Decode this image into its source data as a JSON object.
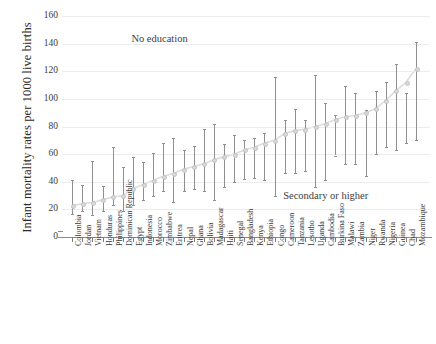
{
  "chart_data": {
    "type": "line",
    "title": "",
    "subtitle": "",
    "xlabel": "",
    "ylabel": "Infant mortality rates per 1000 live births",
    "ylim": [
      0,
      160
    ],
    "yticks": [
      0,
      20,
      40,
      60,
      80,
      100,
      120,
      140,
      160
    ],
    "grid": true,
    "legend_position": "none",
    "annotations": [
      {
        "text": "No education",
        "x_index": 10,
        "y_value": 143
      },
      {
        "text": "Secondary or higher",
        "x_index": 25,
        "y_value": 30
      }
    ],
    "categories": [
      "Colombia",
      "Jordan",
      "Vietnam",
      "Honduras",
      "Philippines",
      "Dominican Republic",
      "Egypt",
      "Indonesia",
      "Morocco",
      "Zimbabwe",
      "Eritrea",
      "Nepal",
      "Ghana",
      "Bolivia",
      "Madagascar",
      "Haiti",
      "Senegal",
      "Bangladesh",
      "Kenya",
      "Ethiopia",
      "Congo",
      "Cameroon",
      "Tanzania",
      "Lesotho",
      "Uganda",
      "Cambodia",
      "Burkina Faso",
      "Malawi",
      "Zambia",
      "Niger",
      "Rwanda",
      "Nigeria",
      "Guinea",
      "Chad",
      "Mozambique"
    ],
    "series": [
      {
        "name": "Point estimate",
        "values": [
          23,
          24,
          25,
          27,
          29,
          30,
          35,
          38,
          41,
          44,
          46,
          49,
          51,
          53,
          56,
          58,
          60,
          63,
          65,
          68,
          70,
          75,
          77,
          78,
          80,
          82,
          85,
          87,
          88,
          90,
          93,
          99,
          106,
          112,
          122
        ]
      }
    ],
    "error_bars": {
      "description": "Vertical range bars spanning the no-education and secondary-or-higher estimates",
      "lower": [
        17,
        19,
        16,
        19,
        23,
        19,
        23,
        27,
        30,
        33,
        25,
        33,
        35,
        33,
        27,
        36,
        40,
        42,
        43,
        41,
        30,
        46,
        46,
        48,
        36,
        41,
        59,
        53,
        53,
        44,
        60,
        65,
        63,
        68,
        70
      ],
      "upper": [
        41,
        38,
        55,
        37,
        65,
        51,
        58,
        54,
        61,
        68,
        72,
        63,
        66,
        78,
        82,
        67,
        74,
        70,
        72,
        75,
        116,
        85,
        93,
        85,
        117,
        97,
        88,
        109,
        104,
        92,
        106,
        112,
        125,
        104,
        141
      ]
    }
  }
}
